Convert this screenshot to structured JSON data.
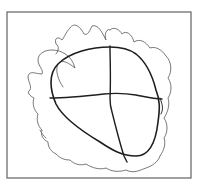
{
  "figure": {
    "width": 201,
    "height": 188,
    "background": "#ffffff",
    "frame": {
      "x": 7,
      "y": 12,
      "width": 184,
      "height": 166,
      "stroke": "#6e6e6e",
      "stroke_width": 1.3
    },
    "strokes": [
      {
        "name": "outer-scribble-outline",
        "color": "#555555",
        "width": 0.8,
        "d": "M63 87 C58 80 55 70 58 64 C62 58 70 64 75 68 C72 56 62 50 52 50 C44 50 38 54 38 60 C38 66 44 70 42 74 C36 74 30 70 28 76 C28 82 32 86 30 90 C26 92 30 96 34 98 C32 104 34 110 38 114 C36 120 38 126 42 130 C40 136 44 140 48 142 C48 148 52 152 56 154 C60 158 64 160 70 160 C74 164 80 166 86 164 C92 168 100 170 106 168 C112 172 120 172 126 170 C134 174 140 170 146 168 C152 166 158 162 160 156 C164 150 166 144 164 138 C168 132 168 124 164 118 C168 112 170 104 168 98 C172 92 172 84 168 78 C172 72 172 62 166 56 C162 50 156 46 150 48 C146 42 140 38 134 42 C132 34 126 30 122 34 C120 30 114 26 110 30 C106 28 104 36 106 40 C102 32 98 24 92 26 C90 30 88 36 84 34 C80 26 74 22 70 28 C66 32 64 38 62 40 C58 36 54 38 56 44 C60 46 58 52 56 54"
      },
      {
        "name": "head-oval",
        "color": "#1e1e1e",
        "width": 1.6,
        "d": "M110 47 C92 47 70 52 58 64 C48 74 50 90 56 104 C62 116 80 130 100 142 C112 150 122 156 136 156 C150 156 156 140 158 122 C160 108 160 100 156 90 C152 74 146 62 136 54 C128 48 120 47 110 47"
      },
      {
        "name": "vertical-guideline",
        "color": "#1e1e1e",
        "width": 1.4,
        "d": "M110 46 C110 60 111 80 110 98 C110 104 110 106 112 112 C116 128 120 144 124 156 C125 158 126 160 127 162"
      },
      {
        "name": "horizontal-guideline",
        "color": "#1e1e1e",
        "width": 1.4,
        "d": "M50 98 C66 98 86 96 104 94 C114 93 124 93 136 95 C146 97 154 99 162 99"
      },
      {
        "name": "ear-mark",
        "color": "#333333",
        "width": 1.0,
        "d": "M160 98 C162 104 164 108 161 114"
      },
      {
        "name": "left-hatch-mark",
        "color": "#777777",
        "width": 1.0,
        "d": "M40 130 C42 134 44 136 46 138"
      }
    ]
  }
}
